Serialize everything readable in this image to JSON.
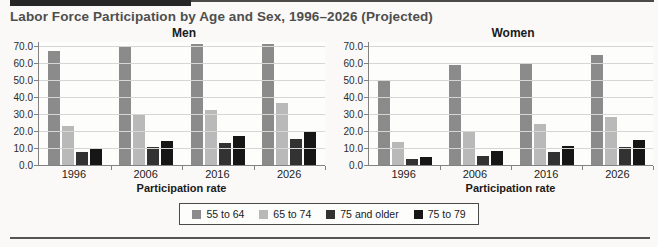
{
  "header": {
    "title": "Labor Force Participation by Age and Sex, 1996–2026 (Projected)"
  },
  "colors": {
    "series": [
      "#8b8b8b",
      "#b9b9b9",
      "#323232",
      "#161616"
    ],
    "grid": "#d6d6d4",
    "axis": "#828282",
    "title_text": "#4e4e4e"
  },
  "legend": {
    "position": "bottom-center-shared",
    "items": [
      {
        "label": "55 to 64",
        "color": "#8b8b8b"
      },
      {
        "label": "65 to 74",
        "color": "#b9b9b9"
      },
      {
        "label": "75 and older",
        "color": "#323232"
      },
      {
        "label": "75 to 79",
        "color": "#161616"
      }
    ]
  },
  "chart_data": [
    {
      "type": "bar",
      "title": "Men",
      "xlabel": "Participation rate",
      "categories": [
        "1996",
        "2006",
        "2016",
        "2026"
      ],
      "series": [
        {
          "name": "55 to 64",
          "values": [
            67.0,
            70.0,
            71.0,
            71.5
          ]
        },
        {
          "name": "65 to 74",
          "values": [
            23.0,
            29.5,
            32.5,
            36.5
          ]
        },
        {
          "name": "75 and older",
          "values": [
            7.5,
            10.5,
            13.0,
            15.5
          ]
        },
        {
          "name": "75 to 79",
          "values": [
            10.0,
            14.0,
            17.0,
            20.0
          ]
        }
      ],
      "ylim": [
        0,
        73
      ],
      "yticks": [
        "0.0",
        "10.0",
        "20.0",
        "30.0",
        "40.0",
        "50.0",
        "60.0",
        "70.0"
      ],
      "grid": true
    },
    {
      "type": "bar",
      "title": "Women",
      "xlabel": "Participation rate",
      "categories": [
        "1996",
        "2006",
        "2016",
        "2026"
      ],
      "series": [
        {
          "name": "55 to 64",
          "values": [
            49.5,
            59.0,
            59.5,
            65.0
          ]
        },
        {
          "name": "65 to 74",
          "values": [
            13.5,
            20.0,
            24.0,
            28.0
          ]
        },
        {
          "name": "75 and older",
          "values": [
            3.5,
            5.5,
            7.5,
            10.5
          ]
        },
        {
          "name": "75 to 79",
          "values": [
            5.0,
            8.0,
            11.0,
            14.5
          ]
        }
      ],
      "ylim": [
        0,
        73
      ],
      "yticks": [
        "0.0",
        "10.0",
        "20.0",
        "30.0",
        "40.0",
        "50.0",
        "60.0",
        "70.0"
      ],
      "grid": true
    }
  ]
}
